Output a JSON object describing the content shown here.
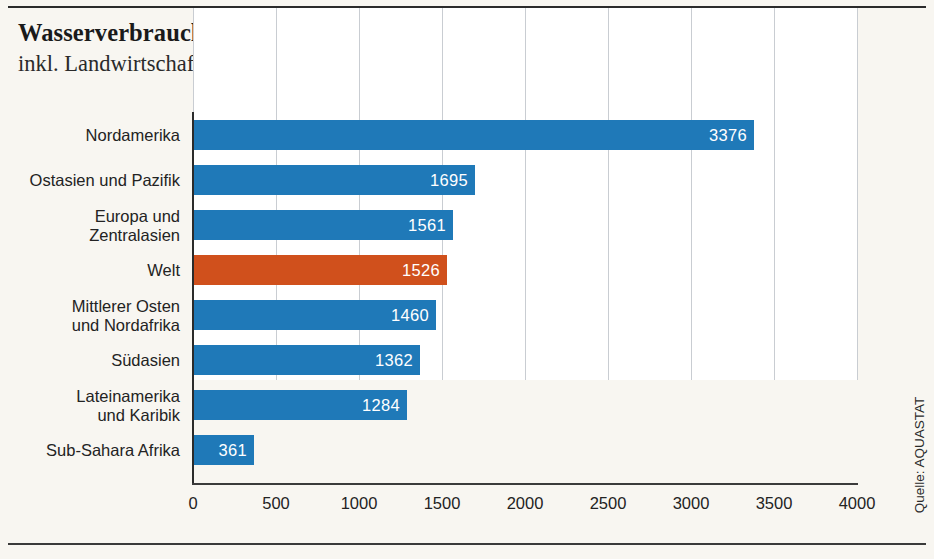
{
  "chart_data": {
    "type": "bar",
    "orientation": "horizontal",
    "title": "Wasserverbrauch pro Person und Tag, 2020",
    "subtitle": "inkl. Landwirtschaft und Industrie (in Liter)",
    "xlabel": "",
    "ylabel": "",
    "xlim": [
      0,
      4000
    ],
    "xticks": [
      "0",
      "500",
      "1000",
      "1500",
      "2000",
      "2500",
      "3000",
      "3500",
      "4000"
    ],
    "xtick_values": [
      0,
      500,
      1000,
      1500,
      2000,
      2500,
      3000,
      3500,
      4000
    ],
    "grid": "vertical",
    "legend": "none",
    "categories": [
      "Nordamerika",
      "Ostasien und Pazifik",
      "Europa und\nZentralasien",
      "Welt",
      "Mittlerer Osten\nund Nordafrika",
      "Südasien",
      "Lateinamerika\nund Karibik",
      "Sub-Sahara Afrika"
    ],
    "values": [
      3376,
      1695,
      1561,
      1526,
      1460,
      1362,
      1284,
      361
    ],
    "value_labels": [
      "3376",
      "1695",
      "1561",
      "1526",
      "1460",
      "1362",
      "1284",
      "361"
    ],
    "highlight_index": 3,
    "colors": {
      "bar": "#1f79b8",
      "bar_highlight": "#d0501c",
      "value_label": "#ffffff",
      "gridline": "#c9cdd2",
      "axis": "#2b2b2b",
      "plot_background": "#ffffff",
      "page_background": "#f8f6f1",
      "text": "#232323"
    },
    "source": "Quelle: AQUASTAT"
  }
}
